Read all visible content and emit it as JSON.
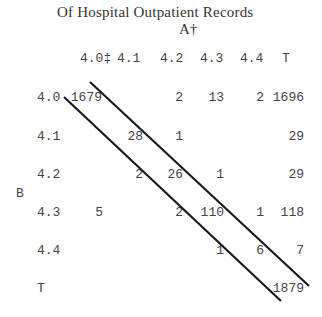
{
  "table": {
    "title": "Of Hospital Outpatient Records",
    "column_axis_label": "A†",
    "row_axis_label": "B",
    "column_headers": [
      "4.0‡",
      "4.1",
      "4.2",
      "4.3",
      "4.4",
      "T"
    ],
    "row_headers": [
      "4.0",
      "4.1",
      "4.2",
      "4.3",
      "4.4",
      "T"
    ],
    "rows": [
      {
        "label": "4.0",
        "cells": [
          "1679",
          "",
          "2",
          "13",
          "2",
          "1696"
        ]
      },
      {
        "label": "4.1",
        "cells": [
          "",
          "28",
          "1",
          "",
          "",
          "29"
        ]
      },
      {
        "label": "4.2",
        "cells": [
          "",
          "2",
          "26",
          "1",
          "",
          "29"
        ]
      },
      {
        "label": "4.3",
        "cells": [
          "5",
          "",
          "2",
          "110",
          "1",
          "118"
        ]
      },
      {
        "label": "4.4",
        "cells": [
          "",
          "",
          "",
          "1",
          "6",
          "7"
        ]
      },
      {
        "label": "T",
        "cells": [
          "",
          "",
          "",
          "",
          "",
          "1879"
        ]
      }
    ]
  }
}
